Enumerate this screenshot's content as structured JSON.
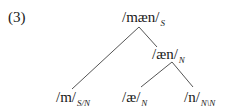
{
  "example_number": "(3)",
  "tree": {
    "root": {
      "form": "/mæn/",
      "category": "S"
    },
    "node_aen": {
      "form": "/æn/",
      "category": "N"
    },
    "leaves": [
      {
        "form": "/m/",
        "category": "S/N"
      },
      {
        "form": "/æ/",
        "category": "N"
      },
      {
        "form": "/n/",
        "category": "N\\N"
      }
    ]
  },
  "colors": {
    "line": "#555555",
    "text": "#1a1a1a"
  }
}
